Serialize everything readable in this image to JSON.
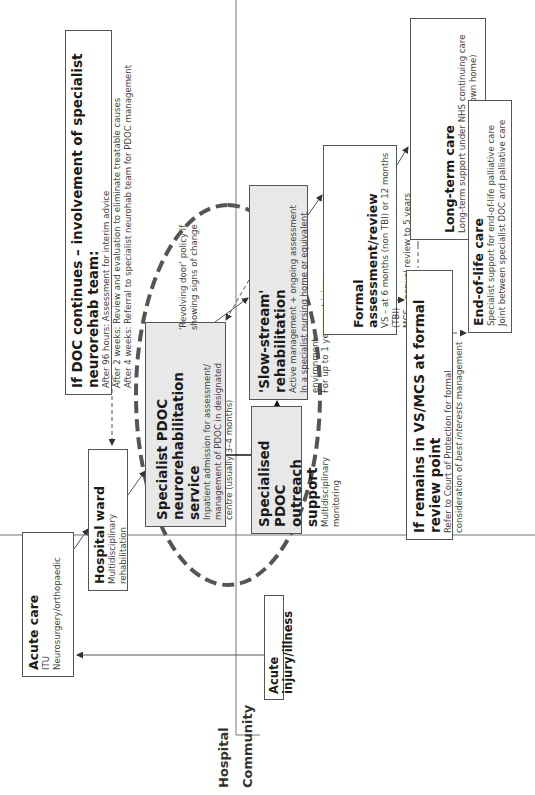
{
  "regions": {
    "hospital": "Hospital",
    "community": "Community"
  },
  "boxes": {
    "acute_care": {
      "title": "Acute care",
      "lines": [
        "ITU",
        "Neurosurgery/orthopaedic"
      ]
    },
    "hospital_ward": {
      "title": "Hospital ward",
      "lines": [
        "Multidisciplinary rehabilitation"
      ]
    },
    "doc_continues": {
      "title": "If DOC continues – involvement of specialist neurorehab team:",
      "lines": [
        "After 96 hours: Assessment for interim advice",
        "After 2 weeks: Review and evaluation to eliminate treatable causes",
        "After 4 weeks: Referral to specialist neurohab team for PDOC management"
      ]
    },
    "specialist_pdoc": {
      "title_1": "Specialist PDOC",
      "title_2": "neurorehabilitation service",
      "lines": [
        "Inpatient admission for assessment/",
        "management of PDOC in designated",
        "centre (usually 3–4 months)"
      ]
    },
    "outreach": {
      "title_1": "Specialised PDOC",
      "title_2": "outreach support",
      "lines": [
        "Multidisciplinary monitoring"
      ]
    },
    "slow_stream": {
      "title": "'Slow-stream' rehabilitation",
      "lines": [
        "Active management + ongoing assessment",
        "In a specialist nursing home or equivalent environment",
        "For up to 1 year post injury"
      ]
    },
    "formal_review": {
      "title": "Formal assessment/review",
      "lines": [
        "VS – at 6 months (non TBI) or 12 months (TBI)",
        "MCS – annual review to 5 years"
      ]
    },
    "long_term": {
      "title": "Long-term care",
      "lines": [
        "Long-term support under NHS continuing care",
        "in specialist nursing home (or own home)"
      ]
    },
    "remains_vs": {
      "title": "If remains in VS/MCS at formal review point",
      "line_1": "Refer to Court of Protection for formal",
      "line_2_pre": "consideration of ",
      "line_2_em": "best interests",
      "line_2_post": " management"
    },
    "end_of_life": {
      "title": "End-of-life care",
      "lines": [
        "Specialist support for end-of-life palliative care",
        "Joint between specialist DOC and palliative care"
      ]
    },
    "acute_injury": {
      "title": "Acute injury/illness"
    }
  },
  "notes": {
    "revolving_door_1": "'Revolving door' policy if",
    "revolving_door_2": "showing signs of change"
  },
  "colors": {
    "border": "#555555",
    "gray_fill": "#e8e8e8",
    "dashed_ellipse": "#555555"
  }
}
